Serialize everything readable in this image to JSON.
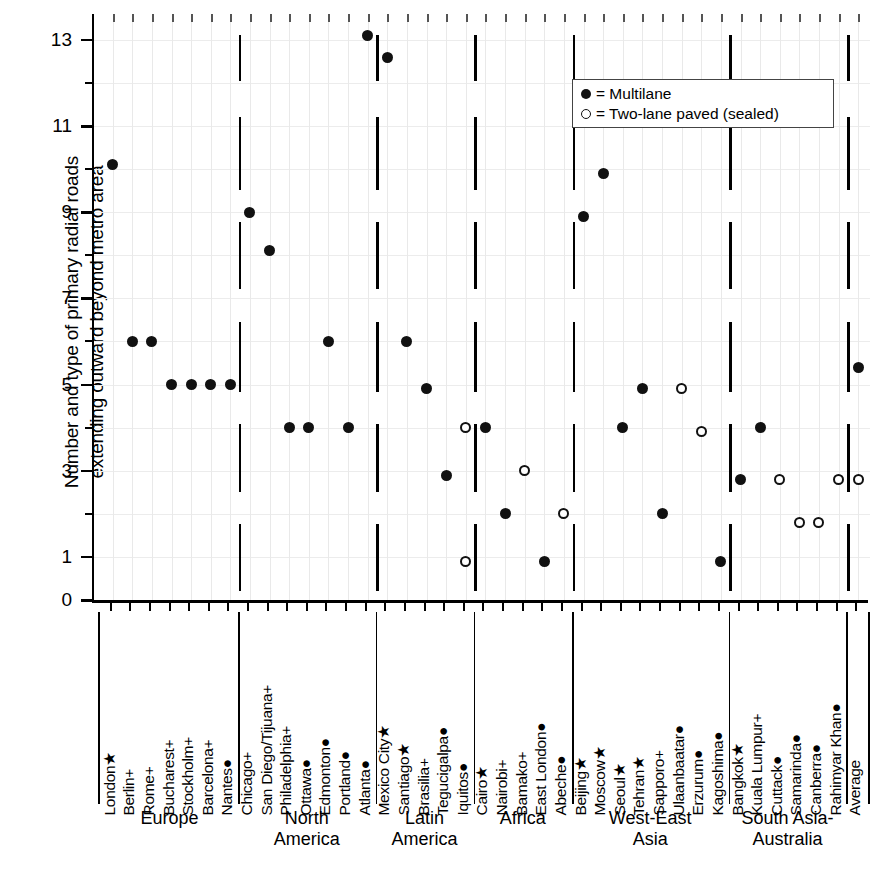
{
  "chart_data": {
    "type": "scatter",
    "title": "",
    "ylabel_line1": "Number and type of primary radial roads",
    "ylabel_line2": "extending outward beyond metro area",
    "xlabel": "",
    "ylim": [
      0,
      13.6
    ],
    "yticks_major": [
      0,
      1,
      3,
      5,
      7,
      9,
      11,
      13
    ],
    "yticks_minor": [
      2,
      4,
      6,
      8,
      10,
      12
    ],
    "ytick_labels": [
      "0",
      "1",
      "3",
      "5",
      "7",
      "9",
      "11",
      "13"
    ],
    "grid": true,
    "legend_position": "top-right",
    "legend": [
      {
        "marker": "filled",
        "symbol": "●",
        "label": "= Multilane"
      },
      {
        "marker": "open",
        "symbol": "○",
        "label": "= Two-lane paved (sealed)"
      }
    ],
    "groups": [
      {
        "name": "Europe",
        "label_lines": [
          "Europe"
        ],
        "cities": [
          {
            "name": "London★",
            "points": [
              {
                "value": 10.1,
                "marker": "filled"
              }
            ]
          },
          {
            "name": "Berlin+",
            "points": [
              {
                "value": 6,
                "marker": "filled"
              }
            ]
          },
          {
            "name": "Rome+",
            "points": [
              {
                "value": 6,
                "marker": "filled"
              }
            ]
          },
          {
            "name": "Bucharest+",
            "points": [
              {
                "value": 5,
                "marker": "filled"
              }
            ]
          },
          {
            "name": "Stockholm+",
            "points": [
              {
                "value": 5,
                "marker": "filled"
              }
            ]
          },
          {
            "name": "Barcelona+",
            "points": [
              {
                "value": 5,
                "marker": "filled"
              }
            ]
          },
          {
            "name": "Nantes●",
            "points": [
              {
                "value": 5,
                "marker": "filled"
              }
            ]
          }
        ]
      },
      {
        "name": "North America",
        "label_lines": [
          "North",
          "America"
        ],
        "cities": [
          {
            "name": "Chicago+",
            "points": [
              {
                "value": 9,
                "marker": "filled"
              }
            ]
          },
          {
            "name": "San Diego/Tijuana+",
            "points": [
              {
                "value": 8.1,
                "marker": "filled"
              }
            ]
          },
          {
            "name": "Philadelphia+",
            "points": [
              {
                "value": 4,
                "marker": "filled"
              }
            ]
          },
          {
            "name": "Ottawa●",
            "points": [
              {
                "value": 4,
                "marker": "filled"
              }
            ]
          },
          {
            "name": "Edmonton●",
            "points": [
              {
                "value": 6,
                "marker": "filled"
              }
            ]
          },
          {
            "name": "Portland●",
            "points": [
              {
                "value": 4,
                "marker": "filled"
              }
            ]
          },
          {
            "name": "Atlanta●",
            "points": [
              {
                "value": 13.1,
                "marker": "filled"
              }
            ]
          }
        ]
      },
      {
        "name": "Latin America",
        "label_lines": [
          "Latin",
          "America"
        ],
        "cities": [
          {
            "name": "Mexico City★",
            "points": [
              {
                "value": 12.6,
                "marker": "filled"
              }
            ]
          },
          {
            "name": "Santiago★",
            "points": [
              {
                "value": 6,
                "marker": "filled"
              }
            ]
          },
          {
            "name": "Brasilia+",
            "points": [
              {
                "value": 4.9,
                "marker": "filled"
              }
            ]
          },
          {
            "name": "Tegucigalpa●",
            "points": [
              {
                "value": 2.9,
                "marker": "filled"
              }
            ]
          },
          {
            "name": "Iquitos●",
            "points": [
              {
                "value": 4,
                "marker": "open"
              },
              {
                "value": 0.9,
                "marker": "open"
              }
            ]
          }
        ]
      },
      {
        "name": "Africa",
        "label_lines": [
          "Africa"
        ],
        "cities": [
          {
            "name": "Cairo★",
            "points": [
              {
                "value": 4,
                "marker": "filled"
              }
            ]
          },
          {
            "name": "Nairobi+",
            "points": [
              {
                "value": 2,
                "marker": "filled"
              }
            ]
          },
          {
            "name": "Bamako+",
            "points": [
              {
                "value": 3,
                "marker": "open"
              }
            ]
          },
          {
            "name": "East London●",
            "points": [
              {
                "value": 0.9,
                "marker": "filled"
              }
            ]
          },
          {
            "name": "Abeche●",
            "points": [
              {
                "value": 2,
                "marker": "open"
              }
            ]
          }
        ]
      },
      {
        "name": "West-East Asia",
        "label_lines": [
          "West-East",
          "Asia"
        ],
        "cities": [
          {
            "name": "Beijing★",
            "points": [
              {
                "value": 8.9,
                "marker": "filled"
              }
            ]
          },
          {
            "name": "Moscow★",
            "points": [
              {
                "value": 9.9,
                "marker": "filled"
              }
            ]
          },
          {
            "name": "Seoul★",
            "points": [
              {
                "value": 4,
                "marker": "filled"
              }
            ]
          },
          {
            "name": "Tehran★",
            "points": [
              {
                "value": 4.9,
                "marker": "filled"
              }
            ]
          },
          {
            "name": "Sapporo+",
            "points": [
              {
                "value": 2,
                "marker": "filled"
              }
            ]
          },
          {
            "name": "Ulaanbaatar●",
            "points": [
              {
                "value": 4.9,
                "marker": "open"
              }
            ]
          },
          {
            "name": "Erzurum●",
            "points": [
              {
                "value": 3.9,
                "marker": "open"
              }
            ]
          },
          {
            "name": "Kagoshima●",
            "points": [
              {
                "value": 0.9,
                "marker": "filled"
              }
            ]
          }
        ]
      },
      {
        "name": "South Asia-Australia",
        "label_lines": [
          "South Asia-",
          "Australia"
        ],
        "cities": [
          {
            "name": "Bangkok★",
            "points": [
              {
                "value": 2.8,
                "marker": "filled"
              }
            ]
          },
          {
            "name": "Kuala Lumpur+",
            "points": [
              {
                "value": 4,
                "marker": "filled"
              }
            ]
          },
          {
            "name": "Cuttack●",
            "points": [
              {
                "value": 2.8,
                "marker": "open"
              }
            ]
          },
          {
            "name": "Samarinda●",
            "points": [
              {
                "value": 1.8,
                "marker": "open"
              }
            ]
          },
          {
            "name": "Canberra●",
            "points": [
              {
                "value": 1.8,
                "marker": "open"
              }
            ]
          },
          {
            "name": "Rahimyar Khan●",
            "points": [
              {
                "value": 2.8,
                "marker": "open"
              }
            ]
          }
        ]
      },
      {
        "name": "Average",
        "label_lines": [],
        "cities": [
          {
            "name": "Average",
            "points": [
              {
                "value": 5.4,
                "marker": "filled"
              },
              {
                "value": 2.8,
                "marker": "open"
              }
            ]
          }
        ]
      }
    ]
  }
}
